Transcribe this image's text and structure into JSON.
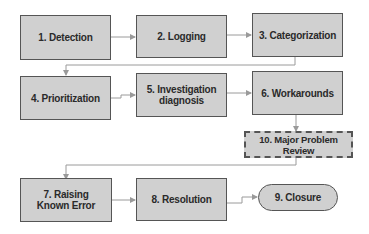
{
  "diagram": {
    "type": "flowchart",
    "title": "",
    "nodes": [
      {
        "id": "n1",
        "label": "1. Detection",
        "shape": "rectangle"
      },
      {
        "id": "n2",
        "label": "2. Logging",
        "shape": "rectangle"
      },
      {
        "id": "n3",
        "label": "3. Categorization",
        "shape": "rectangle"
      },
      {
        "id": "n4",
        "label": "4. Prioritization",
        "shape": "rectangle"
      },
      {
        "id": "n5",
        "label_line1": "5. Investigation",
        "label_line2": "diagnosis",
        "shape": "rectangle"
      },
      {
        "id": "n6",
        "label": "6. Workarounds",
        "shape": "rectangle"
      },
      {
        "id": "n10",
        "label": "10. Major Problem Review",
        "shape": "dashed-rectangle"
      },
      {
        "id": "n7",
        "label_line1": "7. Raising",
        "label_line2": "Known Error",
        "shape": "rectangle"
      },
      {
        "id": "n8",
        "label": "8. Resolution",
        "shape": "rectangle"
      },
      {
        "id": "n9",
        "label": "9. Closure",
        "shape": "rounded-pill"
      }
    ],
    "edges": [
      {
        "from": "n1",
        "to": "n2"
      },
      {
        "from": "n2",
        "to": "n3"
      },
      {
        "from": "n3",
        "to": "n4"
      },
      {
        "from": "n4",
        "to": "n5"
      },
      {
        "from": "n5",
        "to": "n6"
      },
      {
        "from": "n6",
        "to": "n10"
      },
      {
        "from": "n10",
        "to": "n7"
      },
      {
        "from": "n7",
        "to": "n8"
      },
      {
        "from": "n8",
        "to": "n9"
      }
    ],
    "colors": {
      "box_fill": "#d0d0d0",
      "border": "#555555",
      "line": "#9a9a9a",
      "text": "#2a2a2a"
    }
  }
}
